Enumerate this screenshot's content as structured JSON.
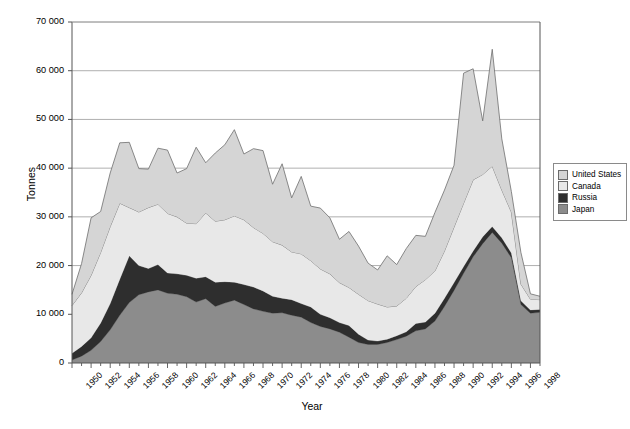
{
  "chart_data": {
    "type": "area",
    "stacked": true,
    "title": "",
    "xlabel": "Year",
    "ylabel": "Tonnes",
    "ylim": [
      0,
      70000
    ],
    "yticks": [
      0,
      10000,
      20000,
      30000,
      40000,
      50000,
      60000,
      70000
    ],
    "ytick_labels": [
      "0",
      "10 000",
      "20 000",
      "30 000",
      "40 000",
      "50 000",
      "60 000",
      "70 000"
    ],
    "xlim": [
      1950,
      1999
    ],
    "xticks": [
      1950,
      1952,
      1954,
      1956,
      1958,
      1960,
      1962,
      1964,
      1966,
      1968,
      1970,
      1972,
      1974,
      1976,
      1978,
      1980,
      1982,
      1984,
      1986,
      1988,
      1990,
      1992,
      1994,
      1996,
      1998
    ],
    "xtick_labels": [
      "1950",
      "1952",
      "1954",
      "1956",
      "1958",
      "1960",
      "1962",
      "1964",
      "1966",
      "1968",
      "1970",
      "1972",
      "1974",
      "1976",
      "1978",
      "1980",
      "1982",
      "1984",
      "1986",
      "1988",
      "1990",
      "1992",
      "1994",
      "1996",
      "1998"
    ],
    "minor_tick_interval": 1,
    "grid": "horizontal",
    "legend_position": "right",
    "x": [
      1950,
      1951,
      1952,
      1953,
      1954,
      1955,
      1956,
      1957,
      1958,
      1959,
      1960,
      1961,
      1962,
      1963,
      1964,
      1965,
      1966,
      1967,
      1968,
      1969,
      1970,
      1971,
      1972,
      1973,
      1974,
      1975,
      1976,
      1977,
      1978,
      1979,
      1980,
      1981,
      1982,
      1983,
      1984,
      1985,
      1986,
      1987,
      1988,
      1989,
      1990,
      1991,
      1992,
      1993,
      1994,
      1995,
      1996,
      1997,
      1998,
      1999
    ],
    "series": [
      {
        "name": "Japan",
        "color": "#8c8c8c",
        "stack_order": 1,
        "values": [
          600,
          1400,
          2600,
          4400,
          6800,
          9800,
          12400,
          14000,
          14600,
          15000,
          14300,
          14100,
          13600,
          12500,
          13200,
          11600,
          12300,
          12900,
          12000,
          11100,
          10600,
          10200,
          10300,
          9800,
          9400,
          8300,
          7500,
          7000,
          6300,
          5300,
          4200,
          3800,
          3800,
          4200,
          4800,
          5500,
          6600,
          7000,
          8600,
          11600,
          14900,
          18400,
          21800,
          24500,
          26800,
          24600,
          21600,
          12000,
          10200,
          10400
        ]
      },
      {
        "name": "Russia",
        "color": "#2e2e2e",
        "stack_order": 2,
        "values": [
          1400,
          2000,
          2600,
          3800,
          5400,
          7400,
          9600,
          6000,
          4800,
          5200,
          4200,
          4200,
          4400,
          4900,
          4500,
          5000,
          4400,
          3700,
          4100,
          4500,
          4200,
          3500,
          3000,
          3200,
          2800,
          3200,
          2500,
          2300,
          2000,
          2400,
          1700,
          900,
          700,
          700,
          800,
          900,
          1500,
          1400,
          1600,
          1700,
          1600,
          1400,
          1200,
          1400,
          1200,
          1100,
          1000,
          800,
          700,
          600
        ]
      },
      {
        "name": "Canada",
        "color": "#e8e8e8",
        "stack_order": 3,
        "values": [
          9800,
          11000,
          12800,
          14500,
          15800,
          15600,
          9900,
          11000,
          12500,
          12400,
          12200,
          11700,
          10700,
          11200,
          13100,
          12500,
          12700,
          13600,
          13300,
          12200,
          11800,
          11200,
          10900,
          9800,
          10200,
          9500,
          9300,
          9000,
          8200,
          7800,
          8200,
          8100,
          7600,
          6600,
          6100,
          6900,
          7600,
          8700,
          8700,
          9700,
          11400,
          13000,
          14600,
          12800,
          12400,
          9800,
          8400,
          3400,
          2200,
          2000
        ]
      },
      {
        "name": "United States",
        "color": "#d5d5d5",
        "stack_order": 4,
        "values": [
          2300,
          6000,
          11800,
          8400,
          11000,
          12400,
          13400,
          8900,
          7900,
          11500,
          13000,
          9000,
          11200,
          15700,
          10300,
          14000,
          15400,
          17700,
          13500,
          16200,
          17000,
          11800,
          16700,
          11100,
          15900,
          11200,
          12500,
          11500,
          8900,
          11500,
          9900,
          7700,
          7000,
          10500,
          8500,
          10200,
          10500,
          8900,
          12000,
          12500,
          12700,
          26700,
          22800,
          11000,
          24000,
          10500,
          4200,
          6500,
          1100,
          700
        ]
      }
    ],
    "peaks": [
      {
        "year": 1994,
        "total": 64400
      },
      {
        "year": 1991,
        "total": 59500
      },
      {
        "year": 1992,
        "total": 60400
      }
    ]
  },
  "legend": {
    "items": [
      {
        "label": "United States",
        "color": "#d5d5d5"
      },
      {
        "label": "Canada",
        "color": "#e8e8e8"
      },
      {
        "label": "Russia",
        "color": "#2e2e2e"
      },
      {
        "label": "Japan",
        "color": "#8c8c8c"
      }
    ]
  },
  "axes": {
    "y_title": "Tonnes",
    "x_title": "Year"
  }
}
